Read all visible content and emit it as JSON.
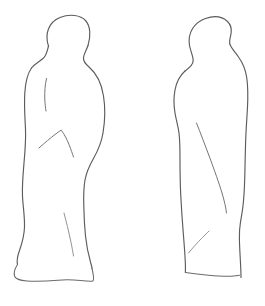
{
  "canvas": {
    "width": 265,
    "height": 306,
    "background_color": "#ffffff",
    "medium": "pen-line-drawing",
    "caption": "Hand-drawn line sketch of two draped standing figures: front view and profile view"
  },
  "palette": {
    "paper": "#ffffff",
    "outline": "#5b5b60",
    "fold_line": "#75757c",
    "fold_line_faint": "#8c8c93",
    "base_line": "#6a6a70"
  },
  "figures": [
    {
      "id": "figure-front",
      "label": "Draped standing figure, front view",
      "view": "front",
      "position": {
        "x": 18,
        "y": 14,
        "width": 96,
        "height": 278
      },
      "parts": [
        {
          "name": "head-and-hood-outline",
          "label": "Head and hood contour"
        },
        {
          "name": "neck-notch-left",
          "label": "Left neck notch"
        },
        {
          "name": "neck-notch-right",
          "label": "Right shoulder notch"
        },
        {
          "name": "body-outline-left",
          "label": "Left body contour"
        },
        {
          "name": "body-outline-right",
          "label": "Right body contour"
        },
        {
          "name": "robe-base",
          "label": "Robe hem and plinth base"
        },
        {
          "name": "drape-fold-chest",
          "label": "Vertical chest drape fold"
        },
        {
          "name": "drape-fold-left-arm",
          "label": "Left arm drape fold"
        },
        {
          "name": "drape-fold-right-arm",
          "label": "Right arm drape fold"
        },
        {
          "name": "drape-fold-lower-skirt",
          "label": "Lower skirt drape fold"
        }
      ]
    },
    {
      "id": "figure-profile",
      "label": "Draped standing figure, profile view",
      "view": "profile",
      "position": {
        "x": 170,
        "y": 16,
        "width": 82,
        "height": 272
      },
      "parts": [
        {
          "name": "head-and-hood-outline",
          "label": "Head and hood contour"
        },
        {
          "name": "neck-notch-front",
          "label": "Front neck notch"
        },
        {
          "name": "back-outline",
          "label": "Back contour"
        },
        {
          "name": "front-outline",
          "label": "Front contour"
        },
        {
          "name": "robe-base",
          "label": "Robe hem and plinth base"
        },
        {
          "name": "drape-fold-long-sweep",
          "label": "Long sweeping drape fold"
        },
        {
          "name": "drape-fold-lower",
          "label": "Lower drape fold"
        }
      ]
    }
  ]
}
